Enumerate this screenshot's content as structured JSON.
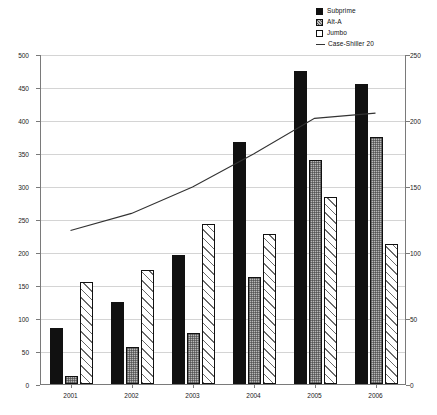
{
  "legend": {
    "items": [
      {
        "label": "Subprime",
        "icon": "filled-square-icon",
        "color": "#111111"
      },
      {
        "label": "Alt-A",
        "icon": "crosshatch-square-icon",
        "color": "#b8b8b8"
      },
      {
        "label": "Jumbo",
        "icon": "open-square-icon",
        "color": "#ffffff"
      },
      {
        "label": "Case-Shiller 20",
        "icon": "line-marker-icon",
        "color": "#333333"
      }
    ]
  },
  "axes": {
    "left": {
      "ticks": [
        "0",
        "50",
        "100",
        "150",
        "200",
        "250",
        "300",
        "350",
        "400",
        "450",
        "500"
      ],
      "min": 0,
      "max": 500,
      "step": 50
    },
    "right": {
      "ticks": [
        "0",
        "50",
        "100",
        "150",
        "200",
        "250"
      ],
      "min": 0,
      "max": 250,
      "step": 50
    },
    "x": {
      "ticks": [
        "2001",
        "2002",
        "2003",
        "2004",
        "2005",
        "2006"
      ]
    }
  },
  "chart_data": {
    "type": "bar",
    "title": "",
    "xlabel": "",
    "ylabel": "",
    "categories": [
      "2001",
      "2002",
      "2003",
      "2004",
      "2005",
      "2006"
    ],
    "ylim": [
      0,
      500
    ],
    "y2lim": [
      0,
      250
    ],
    "grid": true,
    "legend_position": "top-right",
    "series": [
      {
        "name": "Subprime",
        "type": "bar",
        "axis": "left",
        "values": [
          85,
          125,
          195,
          367,
          475,
          455
        ]
      },
      {
        "name": "Alt-A",
        "type": "bar",
        "axis": "left",
        "values": [
          12,
          56,
          77,
          162,
          340,
          375
        ]
      },
      {
        "name": "Jumbo",
        "type": "bar",
        "axis": "left",
        "values": [
          155,
          172,
          242,
          227,
          283,
          212
        ]
      },
      {
        "name": "Case-Shiller 20",
        "type": "line",
        "axis": "right",
        "values": [
          117,
          130,
          150,
          175,
          202,
          206
        ]
      }
    ]
  }
}
